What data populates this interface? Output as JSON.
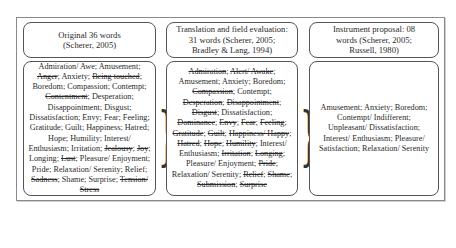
{
  "columns": [
    {
      "header": "Original 36 words (Scherer, 2005)",
      "header_lines": [
        "Original 36 words",
        "(Scherer, 2005)"
      ],
      "words": [
        {
          "text": "Admiration/ Awe",
          "removed": false
        },
        {
          "text": "Amusement",
          "removed": false
        },
        {
          "text": "Anger",
          "removed": true
        },
        {
          "text": "Anxiety",
          "removed": false
        },
        {
          "text": "Being touched",
          "removed": true
        },
        {
          "text": "Boredom",
          "removed": false
        },
        {
          "text": "Compassion",
          "removed": false
        },
        {
          "text": "Contempt",
          "removed": false
        },
        {
          "text": "Contentment",
          "removed": true
        },
        {
          "text": "Desperation",
          "removed": false
        },
        {
          "text": "Disappointment",
          "removed": false
        },
        {
          "text": "Disgust",
          "removed": false
        },
        {
          "text": "Dissatisfaction",
          "removed": false
        },
        {
          "text": "Envy",
          "removed": false
        },
        {
          "text": "Fear",
          "removed": false
        },
        {
          "text": "Feeling",
          "removed": false
        },
        {
          "text": "Gratitude",
          "removed": false
        },
        {
          "text": "Guilt",
          "removed": false
        },
        {
          "text": "Happiness",
          "removed": false
        },
        {
          "text": "Hatred",
          "removed": false
        },
        {
          "text": "Hope",
          "removed": false
        },
        {
          "text": "Humility",
          "removed": false
        },
        {
          "text": "Interest/ Enthusiasm",
          "removed": false
        },
        {
          "text": "Irritation",
          "removed": false
        },
        {
          "text": "Jealousy",
          "removed": true
        },
        {
          "text": "Joy",
          "removed": true
        },
        {
          "text": "Longing",
          "removed": false
        },
        {
          "text": "Lust",
          "removed": true
        },
        {
          "text": "Pleasure/ Enjoyment",
          "removed": false
        },
        {
          "text": "Pride",
          "removed": false
        },
        {
          "text": "Relaxation/ Serenity",
          "removed": false
        },
        {
          "text": "Relief",
          "removed": false
        },
        {
          "text": "Sadness",
          "removed": true
        },
        {
          "text": "Shame",
          "removed": false
        },
        {
          "text": "Surprise",
          "removed": false
        },
        {
          "text": "Tension/ Stress",
          "removed": true
        }
      ]
    },
    {
      "header": "Translation and field evaluation: 31 words (Scherer, 2005; Bradley & Lang, 1994)",
      "header_lines": [
        "Translation and field evaluation:",
        "31 words (Scherer, 2005;",
        "Bradley & Lang, 1994)"
      ],
      "words": [
        {
          "text": "Admiration",
          "removed": true
        },
        {
          "text": "Alert/ Awake",
          "removed": true
        },
        {
          "text": "Amusement",
          "removed": false
        },
        {
          "text": "Anxiety",
          "removed": false
        },
        {
          "text": "Boredom",
          "removed": false
        },
        {
          "text": "Compassion",
          "removed": true
        },
        {
          "text": "Contempt",
          "removed": false
        },
        {
          "text": "Desperation",
          "removed": true
        },
        {
          "text": "Disappointment",
          "removed": true
        },
        {
          "text": "Disgust",
          "removed": true
        },
        {
          "text": "Dissatisfaction",
          "removed": false
        },
        {
          "text": "Dominance",
          "removed": true
        },
        {
          "text": "Envy",
          "removed": true
        },
        {
          "text": "Fear",
          "removed": true
        },
        {
          "text": "Feeling",
          "removed": true
        },
        {
          "text": "Gratitude",
          "removed": true
        },
        {
          "text": "Guilt",
          "removed": true
        },
        {
          "text": "Happiness/ Happy",
          "removed": true
        },
        {
          "text": "Hatred",
          "removed": true
        },
        {
          "text": "Hope",
          "removed": true
        },
        {
          "text": "Humility",
          "removed": true
        },
        {
          "text": "Interest/ Enthusiasm",
          "removed": false
        },
        {
          "text": "Irritation",
          "removed": true
        },
        {
          "text": "Longing",
          "removed": true
        },
        {
          "text": "Pleasure/ Enjoyment",
          "removed": false
        },
        {
          "text": "Pride",
          "removed": true
        },
        {
          "text": "Relaxation/ Serenity",
          "removed": false
        },
        {
          "text": "Relief",
          "removed": true
        },
        {
          "text": "Shame",
          "removed": true
        },
        {
          "text": "Submission",
          "removed": true
        },
        {
          "text": "Surprise",
          "removed": true
        }
      ]
    },
    {
      "header": "Instrument proposal: 08 words (Scherer, 2005; Russell, 1980)",
      "header_lines": [
        "Instrument proposal: 08",
        "words (Scherer, 2005;",
        "Russell, 1980)"
      ],
      "words": [
        {
          "text": "Amusement",
          "removed": false
        },
        {
          "text": "Anxiety",
          "removed": false
        },
        {
          "text": "Boredom",
          "removed": false
        },
        {
          "text": "Contempt/ Indifferent",
          "removed": false
        },
        {
          "text": "Unpleasant/ Dissatisfaction",
          "removed": false
        },
        {
          "text": "Interest/ Enthusiasm",
          "removed": false
        },
        {
          "text": "Pleasure/ Satisfaction",
          "removed": false
        },
        {
          "text": "Relaxation/ Serenity",
          "removed": false
        }
      ]
    }
  ],
  "connectors": [
    {
      "from": 0,
      "to": 1,
      "glyph": "}"
    },
    {
      "from": 1,
      "to": 2,
      "glyph": "}"
    }
  ],
  "colors": {
    "border": "#555555",
    "frame": "#8a8a8a",
    "text": "#2a2a2a",
    "background": "#ffffff"
  }
}
